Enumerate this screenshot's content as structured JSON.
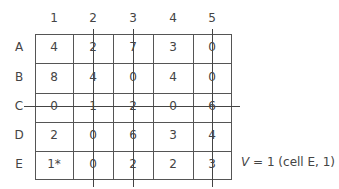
{
  "matrix": {
    "column_headers": [
      "1",
      "2",
      "3",
      "4",
      "5"
    ],
    "row_headers": [
      "A",
      "B",
      "C",
      "D",
      "E"
    ],
    "rows": [
      [
        "4",
        "2",
        "7",
        "3",
        "0"
      ],
      [
        "8",
        "4",
        "0",
        "4",
        "0"
      ],
      [
        "0",
        "1",
        "2",
        "0",
        "6"
      ],
      [
        "2",
        "0",
        "6",
        "3",
        "4"
      ],
      [
        "1*",
        "0",
        "2",
        "2",
        "3"
      ]
    ],
    "struck_columns": [
      "2",
      "3",
      "5"
    ],
    "struck_rows": [
      "C"
    ]
  },
  "annotation": {
    "variable": "V",
    "text": " = 1 (cell E, 1)"
  }
}
